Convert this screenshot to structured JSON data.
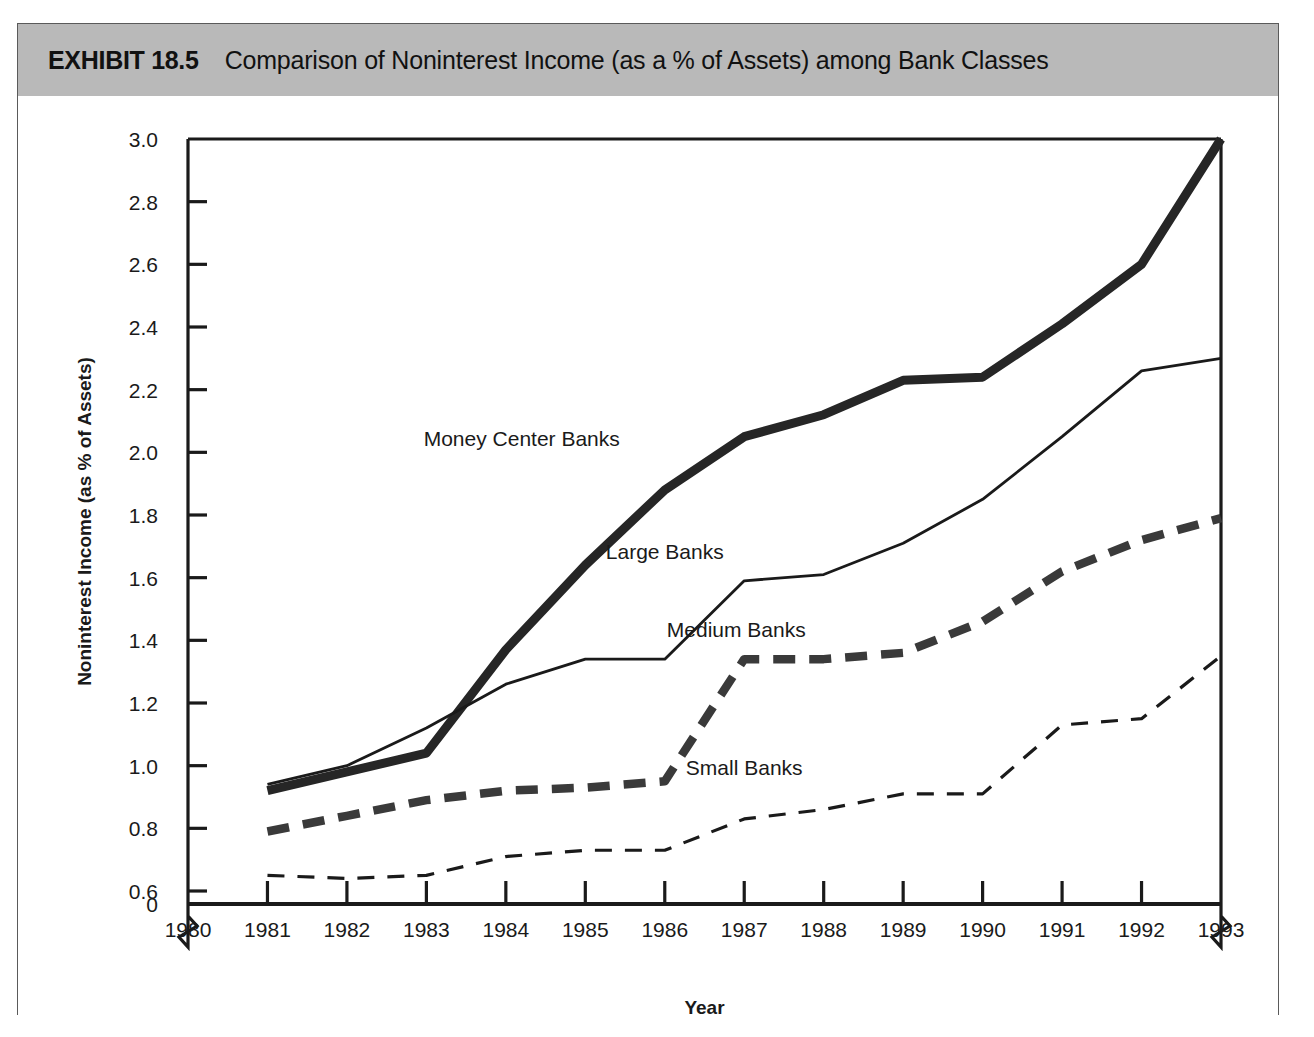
{
  "exhibit": {
    "number": "EXHIBIT 18.5",
    "title": "Comparison of Noninterest Income (as a % of Assets) among Bank Classes"
  },
  "chart_data": {
    "type": "line",
    "title": "Comparison of Noninterest Income (as a % of Assets) among Bank Classes",
    "xlabel": "Year",
    "ylabel": "Noninterest Income (as % of Assets)",
    "x": [
      1981,
      1982,
      1983,
      1984,
      1985,
      1986,
      1987,
      1988,
      1989,
      1990,
      1991,
      1992,
      1993
    ],
    "xticks": [
      "1980",
      "1981",
      "1982",
      "1983",
      "1984",
      "1985",
      "1986",
      "1987",
      "1988",
      "1989",
      "1990",
      "1991",
      "1992",
      "1993"
    ],
    "xlim": [
      1980,
      1993
    ],
    "yticks": [
      "0",
      "0.6",
      "0.8",
      "1.0",
      "1.2",
      "1.4",
      "1.6",
      "1.8",
      "2.0",
      "2.2",
      "2.4",
      "2.6",
      "2.8",
      "3.0"
    ],
    "ylim": [
      0.6,
      3.0
    ],
    "y_axis_break": true,
    "x_axis_break": true,
    "grid": false,
    "legend": "inline-labels",
    "series": [
      {
        "name": "Money Center Banks",
        "style": "thick-solid",
        "color": "#262626",
        "label_x": 1984.2,
        "label_y": 2.02,
        "values": [
          0.92,
          0.98,
          1.04,
          1.37,
          1.64,
          1.88,
          2.05,
          2.12,
          2.23,
          2.24,
          2.41,
          2.6,
          3.0
        ]
      },
      {
        "name": "Large Banks",
        "style": "thin-solid",
        "color": "#1a1a1a",
        "label_x": 1986.0,
        "label_y": 1.66,
        "values": [
          0.94,
          1.0,
          1.12,
          1.26,
          1.34,
          1.34,
          1.59,
          1.61,
          1.71,
          1.85,
          2.05,
          2.26,
          2.3
        ]
      },
      {
        "name": "Medium Banks",
        "style": "thick-dashed",
        "color": "#3a3a3a",
        "label_x": 1986.9,
        "label_y": 1.41,
        "values": [
          0.79,
          0.84,
          0.89,
          0.92,
          0.93,
          0.95,
          1.34,
          1.34,
          1.36,
          1.46,
          1.62,
          1.72,
          1.79
        ]
      },
      {
        "name": "Small Banks",
        "style": "thin-dashed",
        "color": "#1a1a1a",
        "label_x": 1987.0,
        "label_y": 0.97,
        "values": [
          0.65,
          0.64,
          0.65,
          0.71,
          0.73,
          0.73,
          0.83,
          0.86,
          0.91,
          0.91,
          1.13,
          1.15,
          1.35
        ]
      }
    ]
  }
}
